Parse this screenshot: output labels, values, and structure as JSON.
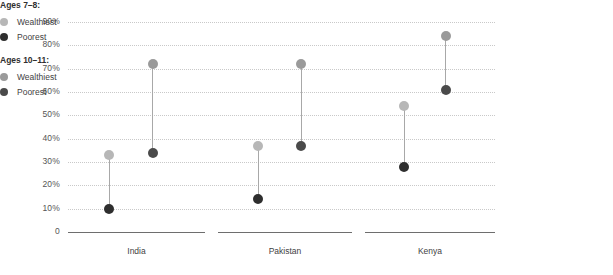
{
  "chart_data": {
    "type": "scatter",
    "title": "",
    "subtitle": "",
    "xlabel": "",
    "ylabel": "",
    "ylim": [
      0,
      90
    ],
    "ytick_labels": [
      "90%",
      "80%",
      "70%",
      "60%",
      "50%",
      "40%",
      "30%",
      "20%",
      "10%",
      "0"
    ],
    "ytick_values": [
      90,
      80,
      70,
      60,
      50,
      40,
      30,
      20,
      10,
      0
    ],
    "grid": true,
    "categories": [
      "India",
      "Pakistan",
      "Kenya"
    ],
    "legend_position": "right",
    "series": [
      {
        "name": "Ages 7–8: Wealthiest",
        "group": "Ages 7–8:",
        "label": "Wealthiest",
        "color": "#b7b7b7",
        "values": [
          33,
          37,
          54
        ]
      },
      {
        "name": "Ages 7–8: Poorest",
        "group": "Ages 7–8:",
        "label": "Poorest",
        "color": "#2e2e2e",
        "values": [
          10,
          14,
          28
        ]
      },
      {
        "name": "Ages 10–11: Wealthiest",
        "group": "Ages 10–11:",
        "label": "Wealthiest",
        "color": "#9a9a9a",
        "values": [
          72,
          72,
          84
        ]
      },
      {
        "name": "Ages 10–11: Poorest",
        "group": "Ages 10–11:",
        "label": "Poorest",
        "color": "#4a4a4a",
        "values": [
          34,
          37,
          61
        ]
      }
    ]
  },
  "legend": {
    "blocks": [
      {
        "title": "Ages 7–8:",
        "items": [
          {
            "label": "Wealthiest",
            "color": "#b7b7b7"
          },
          {
            "label": "Poorest",
            "color": "#2e2e2e"
          }
        ]
      },
      {
        "title": "Ages 10–11:",
        "items": [
          {
            "label": "Wealthiest",
            "color": "#9a9a9a"
          },
          {
            "label": "Poorest",
            "color": "#4a4a4a"
          }
        ]
      }
    ]
  }
}
